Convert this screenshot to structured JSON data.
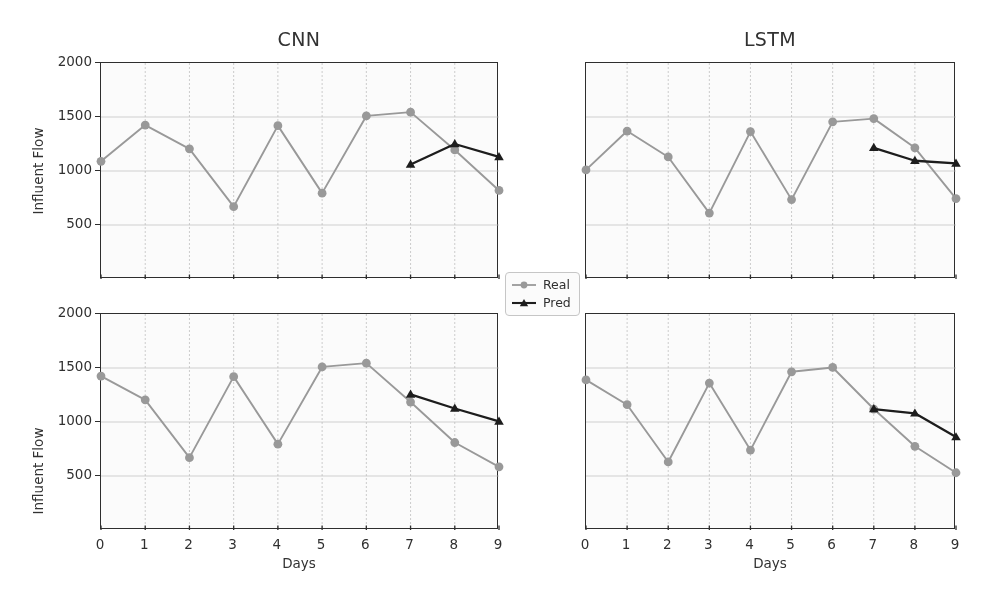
{
  "figure": {
    "legend": {
      "items": [
        {
          "label": "Real",
          "color": "#9a9a9a",
          "marker": "circle"
        },
        {
          "label": "Pred",
          "color": "#1a1a1a",
          "marker": "triangle"
        }
      ]
    }
  },
  "chart_data": [
    {
      "id": "cnn-top",
      "type": "line",
      "title": "CNN",
      "xlabel": "Days",
      "ylabel": "Influent Flow",
      "xlim": [
        0,
        9
      ],
      "ylim": [
        0,
        2000
      ],
      "xticks": [
        0,
        1,
        2,
        3,
        4,
        5,
        6,
        7,
        8,
        9
      ],
      "yticks": [
        500,
        1000,
        1500,
        2000
      ],
      "xtick_labels": [
        "0",
        "1",
        "2",
        "3",
        "4",
        "5",
        "6",
        "7",
        "8",
        "9"
      ],
      "ytick_labels": [
        "500",
        "1000",
        "1500",
        "2000"
      ],
      "grid": true,
      "x": [
        0,
        1,
        2,
        3,
        4,
        5,
        6,
        7,
        8,
        9
      ],
      "series": [
        {
          "name": "Real",
          "color": "#9a9a9a",
          "marker": "circle",
          "x": [
            0,
            1,
            2,
            3,
            4,
            5,
            6,
            7,
            8,
            9
          ],
          "values": [
            1090,
            1425,
            1205,
            670,
            1420,
            795,
            1510,
            1545,
            1195,
            820
          ]
        },
        {
          "name": "Pred",
          "color": "#1a1a1a",
          "marker": "triangle",
          "x": [
            7,
            8,
            9
          ],
          "values": [
            1060,
            1250,
            1130
          ]
        }
      ]
    },
    {
      "id": "lstm-top",
      "type": "line",
      "title": "LSTM",
      "xlabel": "Days",
      "ylabel": "",
      "xlim": [
        0,
        9
      ],
      "ylim": [
        0,
        2000
      ],
      "xticks": [
        0,
        1,
        2,
        3,
        4,
        5,
        6,
        7,
        8,
        9
      ],
      "yticks": [
        500,
        1000,
        1500,
        2000
      ],
      "xtick_labels": [
        "0",
        "1",
        "2",
        "3",
        "4",
        "5",
        "6",
        "7",
        "8",
        "9"
      ],
      "ytick_labels": [
        "",
        "",
        "",
        ""
      ],
      "grid": true,
      "x": [
        0,
        1,
        2,
        3,
        4,
        5,
        6,
        7,
        8,
        9
      ],
      "series": [
        {
          "name": "Real",
          "color": "#9a9a9a",
          "marker": "circle",
          "x": [
            0,
            1,
            2,
            3,
            4,
            5,
            6,
            7,
            8,
            9
          ],
          "values": [
            1010,
            1370,
            1130,
            610,
            1365,
            735,
            1455,
            1485,
            1215,
            745
          ]
        },
        {
          "name": "Pred",
          "color": "#1a1a1a",
          "marker": "triangle",
          "x": [
            7,
            8,
            9
          ],
          "values": [
            1215,
            1095,
            1070
          ]
        }
      ]
    },
    {
      "id": "cnn-bottom",
      "type": "line",
      "title": "",
      "xlabel": "Days",
      "ylabel": "Influent Flow",
      "xlim": [
        0,
        9
      ],
      "ylim": [
        0,
        2000
      ],
      "xticks": [
        0,
        1,
        2,
        3,
        4,
        5,
        6,
        7,
        8,
        9
      ],
      "yticks": [
        500,
        1000,
        1500,
        2000
      ],
      "xtick_labels": [
        "0",
        "1",
        "2",
        "3",
        "4",
        "5",
        "6",
        "7",
        "8",
        "9"
      ],
      "ytick_labels": [
        "500",
        "1000",
        "1500",
        "2000"
      ],
      "grid": true,
      "x": [
        0,
        1,
        2,
        3,
        4,
        5,
        6,
        7,
        8,
        9
      ],
      "series": [
        {
          "name": "Real",
          "color": "#9a9a9a",
          "marker": "circle",
          "x": [
            0,
            1,
            2,
            3,
            4,
            5,
            6,
            7,
            8,
            9
          ],
          "values": [
            1425,
            1205,
            670,
            1420,
            795,
            1510,
            1545,
            1185,
            810,
            585
          ]
        },
        {
          "name": "Pred",
          "color": "#1a1a1a",
          "marker": "triangle",
          "x": [
            7,
            8,
            9
          ],
          "values": [
            1255,
            1125,
            1005
          ]
        }
      ]
    },
    {
      "id": "lstm-bottom",
      "type": "line",
      "title": "",
      "xlabel": "Days",
      "ylabel": "",
      "xlim": [
        0,
        9
      ],
      "ylim": [
        0,
        2000
      ],
      "xticks": [
        0,
        1,
        2,
        3,
        4,
        5,
        6,
        7,
        8,
        9
      ],
      "yticks": [
        500,
        1000,
        1500,
        2000
      ],
      "xtick_labels": [
        "0",
        "1",
        "2",
        "3",
        "4",
        "5",
        "6",
        "7",
        "8",
        "9"
      ],
      "ytick_labels": [
        "",
        "",
        "",
        ""
      ],
      "grid": true,
      "x": [
        0,
        1,
        2,
        3,
        4,
        5,
        6,
        7,
        8,
        9
      ],
      "series": [
        {
          "name": "Real",
          "color": "#9a9a9a",
          "marker": "circle",
          "x": [
            0,
            1,
            2,
            3,
            4,
            5,
            6,
            7,
            8,
            9
          ],
          "values": [
            1390,
            1160,
            630,
            1360,
            740,
            1465,
            1505,
            1120,
            775,
            530
          ]
        },
        {
          "name": "Pred",
          "color": "#1a1a1a",
          "marker": "triangle",
          "x": [
            7,
            8,
            9
          ],
          "values": [
            1120,
            1080,
            860
          ]
        }
      ]
    }
  ]
}
